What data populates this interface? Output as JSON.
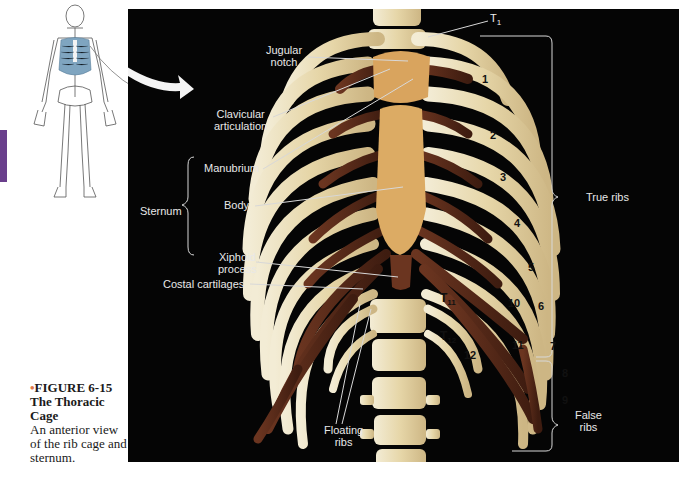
{
  "figure": {
    "number_label": "FIGURE 6-15",
    "title_line1": "The Thoracic",
    "title_line2": "Cage",
    "description": "An anterior view of the rib cage and sternum."
  },
  "colors": {
    "chapter_tab": "#6a3f8c",
    "photo_background": "#050505",
    "bone": "#e9dcb8",
    "cartilage": "#5a2b1a",
    "sternum": "#d9a45e",
    "label_text": "#e8e8e8",
    "lung_highlight": "#7fa5c0"
  },
  "labels": {
    "t1": "T",
    "t1_sub": "1",
    "jugular_notch": [
      "Jugular",
      "notch"
    ],
    "clavicular_articulation": [
      "Clavicular",
      "articulation"
    ],
    "manubrium": "Manubrium",
    "sternum": "Sternum",
    "body": "Body",
    "xiphoid_process": [
      "Xiphoid",
      "process"
    ],
    "costal_cartilages": "Costal cartilages",
    "true_ribs": "True ribs",
    "false_ribs": [
      "False",
      "ribs"
    ],
    "floating_ribs": [
      "Floating",
      "ribs"
    ],
    "t11": "T",
    "t11_sub": "11",
    "t12": "T",
    "t12_sub": "12"
  },
  "rib_numbers": [
    "1",
    "2",
    "3",
    "4",
    "5",
    "6",
    "7",
    "8",
    "9",
    "10",
    "11",
    "12"
  ]
}
